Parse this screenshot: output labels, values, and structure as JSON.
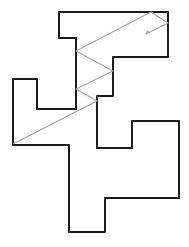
{
  "diagram": {
    "width": 189,
    "height": 247,
    "outline": {
      "stroke": "#1a1a1a",
      "stroke_width": 2,
      "points": [
        [
          59,
          12
        ],
        [
          168,
          12
        ],
        [
          168,
          57
        ],
        [
          113,
          57
        ],
        [
          113,
          96
        ],
        [
          97,
          96
        ],
        [
          97,
          148
        ],
        [
          132,
          148
        ],
        [
          132,
          121
        ],
        [
          179,
          121
        ],
        [
          179,
          198
        ],
        [
          105,
          198
        ],
        [
          105,
          232
        ],
        [
          69,
          232
        ],
        [
          69,
          145
        ],
        [
          13,
          145
        ],
        [
          13,
          79
        ],
        [
          37,
          79
        ],
        [
          37,
          109
        ],
        [
          76,
          109
        ],
        [
          76,
          38
        ],
        [
          59,
          38
        ]
      ]
    },
    "path_line": {
      "stroke": "#a8a8a8",
      "stroke_width": 1.3,
      "points": [
        [
          13,
          144
        ],
        [
          97,
          101
        ],
        [
          76,
          89
        ],
        [
          113,
          71
        ],
        [
          76,
          51
        ],
        [
          151,
          12
        ],
        [
          168,
          23
        ],
        [
          146,
          34
        ]
      ],
      "arrow_end": true
    }
  }
}
